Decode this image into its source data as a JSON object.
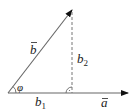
{
  "diagram": {
    "labels": {
      "vector_b": "b",
      "vector_a": "a",
      "component_parallel": "b",
      "component_parallel_sub": "1",
      "component_perp": "b",
      "component_perp_sub": "2",
      "angle": "φ"
    },
    "colors": {
      "line": "#555555",
      "arrow": "#111111",
      "text": "#222222"
    }
  }
}
